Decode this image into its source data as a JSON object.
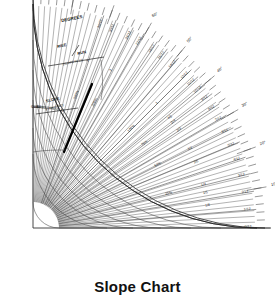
{
  "title": "Slope Chart",
  "labels": {
    "degrees": "DEGREES",
    "rise": "RISE",
    "run": "RUN",
    "slope_in_12": "(SLOPE IN 12)",
    "slope": "SLOPE",
    "gradient": "(GRADIENT)"
  },
  "chart_data": {
    "type": "scatter",
    "title": "Slope Chart",
    "xlabel": "",
    "ylabel": "",
    "grid": false,
    "legend": "none",
    "origin": {
      "x": 33,
      "y": 228
    },
    "radius_outer": 232,
    "radius_inner": 26,
    "angle_range_deg": [
      0,
      90
    ],
    "degree_ticks": {
      "major_labeled": [
        "0°",
        "10°",
        "20°",
        "30°",
        "40°",
        "50°",
        "60°",
        "70°",
        "80°",
        "90°"
      ],
      "minor_step_deg": 2,
      "units": "degrees"
    },
    "rise_run_series": {
      "name": "RISE / RUN (SLOPE IN 12)",
      "entries": [
        {
          "label": "0/12",
          "deg": 0.0
        },
        {
          "label": "1/12",
          "deg": 4.76
        },
        {
          "label": "2/12",
          "deg": 9.46
        },
        {
          "label": "3/12",
          "deg": 14.04
        },
        {
          "label": "4/12",
          "deg": 18.43
        },
        {
          "label": "5/12",
          "deg": 22.62
        },
        {
          "label": "6/12",
          "deg": 26.57
        },
        {
          "label": "7/12",
          "deg": 30.26
        },
        {
          "label": "8/12",
          "deg": 33.69
        },
        {
          "label": "9/12",
          "deg": 36.87
        },
        {
          "label": "10/12",
          "deg": 39.81
        },
        {
          "label": "11/12",
          "deg": 42.51
        },
        {
          "label": "12/12",
          "deg": 45.0
        },
        {
          "label": "14/12",
          "deg": 49.4
        },
        {
          "label": "16/12",
          "deg": 53.13
        },
        {
          "label": "18/12",
          "deg": 56.31
        },
        {
          "label": "21/12",
          "deg": 60.26
        },
        {
          "label": "24/12",
          "deg": 63.43
        },
        {
          "label": "30/12",
          "deg": 68.2
        },
        {
          "label": "36/12",
          "deg": 71.57
        }
      ]
    },
    "percent_series": {
      "name": "SLOPE PERCENT",
      "entries": [
        {
          "label": "25%",
          "deg": 14.04
        },
        {
          "label": "50%",
          "deg": 26.57
        },
        {
          "label": "75%",
          "deg": 36.87
        },
        {
          "label": "100%",
          "deg": 45.0
        },
        {
          "label": "200%",
          "deg": 63.43
        },
        {
          "label": "300%",
          "deg": 71.57
        }
      ]
    },
    "gradient_series": {
      "name": "SLOPE (GRADIENT)",
      "entries": [
        {
          "label": "1/8",
          "deg": 7.13
        },
        {
          "label": "1/5",
          "deg": 11.31
        },
        {
          "label": "1/4",
          "deg": 14.04
        },
        {
          "label": "2/5",
          "deg": 21.8
        },
        {
          "label": "1/2",
          "deg": 26.57
        },
        {
          "label": "2/3",
          "deg": 33.69
        },
        {
          "label": "3/4",
          "deg": 36.87
        },
        {
          "label": "4/5",
          "deg": 38.66
        },
        {
          "label": "1",
          "deg": 45.0
        },
        {
          "label": "2",
          "deg": 63.43
        },
        {
          "label": "3",
          "deg": 71.57
        }
      ]
    },
    "gradient_ratio_series": {
      "name": "GRADIENT RATIO",
      "entries": [
        {
          "label": "25",
          "deg": 76.0
        },
        {
          "label": "50",
          "deg": 78.7
        },
        {
          "label": "75",
          "deg": 80.5
        },
        {
          "label": "100",
          "deg": 81.8
        },
        {
          "label": "200",
          "deg": 84.3
        },
        {
          "label": "300",
          "deg": 85.6
        },
        {
          "label": "500",
          "deg": 86.9
        },
        {
          "label": "1000",
          "deg": 88.0
        },
        {
          "label": "2000",
          "deg": 88.6
        },
        {
          "label": "5000",
          "deg": 89.1
        }
      ]
    }
  }
}
